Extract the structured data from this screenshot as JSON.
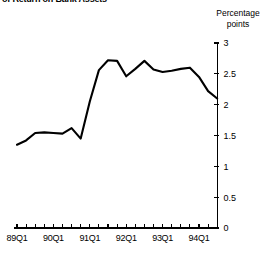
{
  "title": "of Return on Bank Assets",
  "axis_title_lines": [
    "Percentage",
    "points"
  ],
  "chart_data": {
    "type": "line",
    "title": "of Return on Bank Assets",
    "xlabel": "",
    "ylabel": "Percentage points",
    "ylim": [
      0,
      3
    ],
    "yticks": [
      0,
      0.5,
      1,
      1.5,
      2,
      2.5,
      3
    ],
    "ytick_labels": [
      "0",
      "0.5",
      "1",
      "1.5",
      "2",
      "2.5",
      "3"
    ],
    "xtick_labels": [
      "89Q1",
      "90Q1",
      "91Q1",
      "92Q1",
      "93Q1",
      "94Q1"
    ],
    "grid": false,
    "legend": null,
    "x": [
      "89Q1",
      "89Q2",
      "89Q3",
      "89Q4",
      "90Q1",
      "90Q2",
      "90Q3",
      "90Q4",
      "91Q1",
      "91Q2",
      "91Q3",
      "91Q4",
      "92Q1",
      "92Q2",
      "92Q3",
      "92Q4",
      "93Q1",
      "93Q2",
      "93Q3",
      "93Q4",
      "94Q1",
      "94Q2",
      "94Q3"
    ],
    "values": [
      1.35,
      1.42,
      1.54,
      1.55,
      1.54,
      1.53,
      1.62,
      1.45,
      2.05,
      2.56,
      2.72,
      2.71,
      2.46,
      2.58,
      2.71,
      2.57,
      2.53,
      2.55,
      2.58,
      2.6,
      2.45,
      2.22,
      2.1
    ],
    "series": [
      {
        "name": "Rate of Return on Bank Assets",
        "values": [
          1.35,
          1.42,
          1.54,
          1.55,
          1.54,
          1.53,
          1.62,
          1.45,
          2.05,
          2.56,
          2.72,
          2.71,
          2.46,
          2.58,
          2.71,
          2.57,
          2.53,
          2.55,
          2.58,
          2.6,
          2.45,
          2.22,
          2.1
        ]
      }
    ]
  }
}
